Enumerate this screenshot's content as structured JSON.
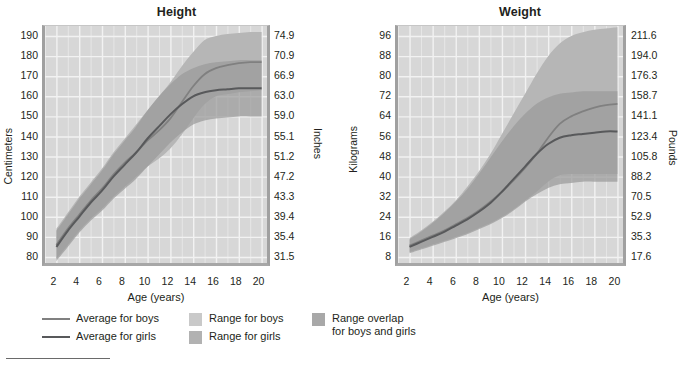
{
  "colors": {
    "plot_background": "#d7d7d7",
    "gridline": "#f2f2f2",
    "band_single": "#b6b6b6",
    "band_overlap": "#9a9a9a",
    "line_boys": "#808080",
    "line_girls": "#58595b",
    "text": "#231f20",
    "panel_border": "#a0a0a0"
  },
  "charts": [
    {
      "id": "height",
      "title": "Height",
      "xlabel": "Age (years)",
      "ylabel_left": "Centimeters",
      "ylabel_right": "Inches",
      "x_ticks": [
        "2",
        "4",
        "6",
        "8",
        "10",
        "12",
        "14",
        "16",
        "18",
        "20"
      ],
      "y_ticks_left": [
        "190",
        "180",
        "170",
        "160",
        "150",
        "140",
        "130",
        "120",
        "110",
        "100",
        "90",
        "80"
      ],
      "y_ticks_right": [
        "74.9",
        "70.9",
        "66.9",
        "63.0",
        "59.0",
        "55.1",
        "51.2",
        "47.2",
        "43.3",
        "39.4",
        "35.4",
        "31.5"
      ]
    },
    {
      "id": "weight",
      "title": "Weight",
      "xlabel": "Age (years)",
      "ylabel_left": "Kilograms",
      "ylabel_right": "Pounds",
      "x_ticks": [
        "2",
        "4",
        "6",
        "8",
        "10",
        "12",
        "14",
        "16",
        "18",
        "20"
      ],
      "y_ticks_left": [
        "96",
        "88",
        "80",
        "72",
        "64",
        "56",
        "48",
        "40",
        "32",
        "24",
        "16",
        "8"
      ],
      "y_ticks_right": [
        "211.6",
        "194.0",
        "176.3",
        "158.7",
        "141.1",
        "123.4",
        "105.8",
        "88.2",
        "70.5",
        "52.9",
        "35.3",
        "17.6"
      ]
    }
  ],
  "legend": {
    "items": [
      {
        "name": "average-for-boys",
        "type": "line",
        "label": "Average for boys",
        "color": "#808080"
      },
      {
        "name": "average-for-girls",
        "type": "line",
        "label": "Average for girls",
        "color": "#58595b"
      },
      {
        "name": "range-for-boys",
        "type": "swatch",
        "label": "Range for boys",
        "color": "#c9c9c9"
      },
      {
        "name": "range-for-girls",
        "type": "swatch",
        "label": "Range for girls",
        "color": "#b2b2b2"
      },
      {
        "name": "range-overlap",
        "type": "swatch",
        "label": "Range overlap\nfor boys and girls",
        "color": "#a8a8a8"
      }
    ]
  },
  "chart_data": [
    {
      "type": "area",
      "id": "height",
      "title": "Height",
      "xlabel": "Age (years)",
      "ylabel": "Centimeters",
      "ylabel_secondary": "Inches",
      "grid": true,
      "legend_position": "below",
      "xlim": [
        1,
        21
      ],
      "ylim": [
        75,
        195
      ],
      "ylim_secondary": [
        29.5,
        76.8
      ],
      "x": [
        2,
        3,
        4,
        5,
        6,
        7,
        8,
        9,
        10,
        11,
        12,
        13,
        14,
        15,
        16,
        17,
        18,
        19,
        20
      ],
      "series": [
        {
          "name": "Average for boys",
          "values": [
            86,
            94,
            101,
            108,
            114,
            121,
            127,
            132,
            138,
            143,
            149,
            157,
            165,
            171,
            174,
            175.5,
            176.5,
            177,
            177
          ]
        },
        {
          "name": "Average for girls",
          "values": [
            85,
            93,
            100,
            107,
            113,
            120,
            126,
            132,
            139,
            145,
            151,
            156,
            160,
            162,
            163,
            163.5,
            164,
            164,
            164
          ]
        }
      ],
      "bands": [
        {
          "name": "Range for boys",
          "lower": [
            79,
            86,
            93,
            99,
            104,
            110,
            115,
            120,
            125,
            129,
            134,
            141,
            149,
            156,
            160,
            161,
            162,
            162.5,
            163
          ],
          "upper": [
            94,
            102,
            110,
            117,
            124,
            132,
            139,
            146,
            153,
            160,
            167,
            175,
            182,
            188,
            190,
            191,
            191.5,
            192,
            192
          ]
        },
        {
          "name": "Range for girls",
          "lower": [
            78,
            85,
            92,
            98,
            103,
            109,
            114,
            119,
            125,
            131,
            137,
            142,
            146,
            148,
            149,
            149.5,
            150,
            150,
            150
          ],
          "upper": [
            93,
            101,
            109,
            116,
            123,
            131,
            138,
            145,
            153,
            160,
            166,
            171,
            174,
            176,
            177,
            177.5,
            178,
            178,
            178
          ]
        }
      ]
    },
    {
      "type": "area",
      "id": "weight",
      "title": "Weight",
      "xlabel": "Age (years)",
      "ylabel": "Kilograms",
      "ylabel_secondary": "Pounds",
      "grid": true,
      "legend_position": "below",
      "xlim": [
        1,
        21
      ],
      "ylim": [
        4,
        100
      ],
      "ylim_secondary": [
        8.8,
        220.5
      ],
      "x": [
        2,
        3,
        4,
        5,
        6,
        7,
        8,
        9,
        10,
        11,
        12,
        13,
        14,
        15,
        16,
        17,
        18,
        19,
        20
      ],
      "series": [
        {
          "name": "Average for boys",
          "values": [
            12.5,
            14.5,
            16.5,
            18.5,
            21,
            23.5,
            26.5,
            30,
            34,
            38.5,
            43.5,
            49,
            55.5,
            61,
            64,
            66,
            67.5,
            68.5,
            69
          ]
        },
        {
          "name": "Average for girls",
          "values": [
            12,
            14,
            16,
            18,
            20.5,
            23,
            26,
            29.5,
            34,
            39,
            44,
            49,
            53,
            55.5,
            56.5,
            57,
            57.5,
            58,
            58
          ]
        }
      ],
      "bands": [
        {
          "name": "Range for boys",
          "lower": [
            10,
            11.5,
            13,
            14.5,
            16,
            17.5,
            19.5,
            21.5,
            24,
            27,
            30.5,
            34,
            38,
            40.5,
            41,
            41,
            41,
            41,
            41
          ],
          "upper": [
            15.5,
            18.5,
            22,
            26,
            30.5,
            36,
            42,
            49,
            57,
            65,
            73,
            81,
            88,
            93,
            96,
            97.5,
            98.5,
            99,
            99.5
          ]
        },
        {
          "name": "Range for girls",
          "lower": [
            9.5,
            11,
            12.5,
            14,
            15.5,
            17,
            19,
            21,
            23.5,
            26.5,
            30,
            33,
            35.5,
            37,
            37.5,
            38,
            38,
            38,
            38
          ],
          "upper": [
            15,
            18,
            21.5,
            25.5,
            30,
            35,
            41,
            47.5,
            54,
            60,
            65,
            69,
            71.5,
            73,
            73.5,
            74,
            74,
            74,
            74
          ]
        }
      ]
    }
  ]
}
